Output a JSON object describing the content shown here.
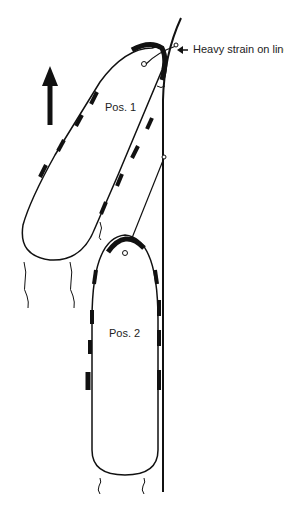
{
  "diagram": {
    "annotation": "Heavy strain on line",
    "vessels": [
      {
        "label": "Pos. 1"
      },
      {
        "label": "Pos. 2"
      }
    ],
    "direction_arrow": "arrow-up-icon",
    "colors": {
      "ink": "#111111",
      "background": "#ffffff"
    }
  }
}
